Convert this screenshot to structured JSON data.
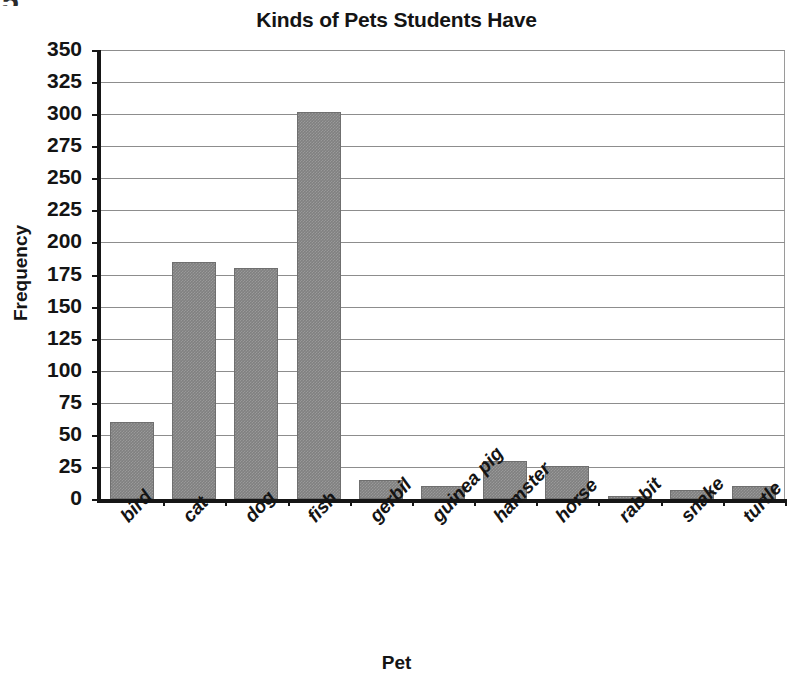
{
  "artifact": {
    "glyph": "5"
  },
  "chart_data": {
    "type": "bar",
    "title": "Kinds of Pets Students Have",
    "xlabel": "Pet",
    "ylabel": "Frequency",
    "categories": [
      "bird",
      "cat",
      "dog",
      "fish",
      "gerbil",
      "guinea pig",
      "hamster",
      "horse",
      "rabbit",
      "snake",
      "turtle"
    ],
    "values": [
      60,
      185,
      180,
      302,
      15,
      10,
      30,
      26,
      2,
      7,
      10
    ],
    "ylim": [
      0,
      350
    ],
    "ytick_step": 25,
    "yticks": [
      0,
      25,
      50,
      75,
      100,
      125,
      150,
      175,
      200,
      225,
      250,
      275,
      300,
      325,
      350
    ],
    "ytick_labels": [
      "0",
      "25",
      "50",
      "75",
      "100",
      "125",
      "150",
      "175",
      "200",
      "225",
      "250",
      "275",
      "300",
      "325",
      "350"
    ],
    "grid": true,
    "legend": false,
    "bar_color": "#808080",
    "axis_color": "#161616",
    "grid_color": "#8d8d8d"
  }
}
